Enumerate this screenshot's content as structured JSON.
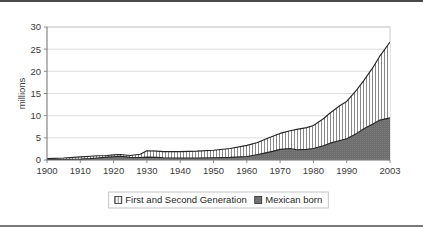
{
  "chart_data": {
    "type": "area",
    "stacked": true,
    "title": "",
    "subtitle": "",
    "xlabel": "",
    "ylabel": "millions",
    "xlim": [
      1900,
      2003
    ],
    "ylim": [
      0,
      30
    ],
    "ytick_values": [
      0,
      5,
      10,
      15,
      20,
      25,
      30
    ],
    "ytick_labels": [
      "0",
      "5",
      "10",
      "15",
      "20",
      "25",
      "30"
    ],
    "xtick_values": [
      1900,
      1910,
      1920,
      1930,
      1940,
      1950,
      1960,
      1970,
      1980,
      1990,
      2003
    ],
    "xtick_labels": [
      "1900",
      "1910",
      "1920",
      "1930",
      "1940",
      "1950",
      "1960",
      "1970",
      "1980",
      "1990",
      "2003"
    ],
    "grid": "horizontal",
    "legend_position": "bottom",
    "x": [
      1900,
      1905,
      1910,
      1913,
      1915,
      1918,
      1920,
      1922,
      1925,
      1928,
      1930,
      1933,
      1935,
      1940,
      1945,
      1950,
      1955,
      1960,
      1963,
      1965,
      1968,
      1970,
      1973,
      1975,
      1978,
      1980,
      1983,
      1985,
      1988,
      1990,
      1993,
      1995,
      1998,
      2000,
      2003
    ],
    "series": [
      {
        "name": "Mexican born",
        "color": "#6e6e6e",
        "pattern": "solid-gray",
        "values": [
          0.1,
          0.12,
          0.2,
          0.3,
          0.45,
          0.65,
          0.75,
          0.85,
          0.6,
          0.55,
          0.65,
          0.6,
          0.5,
          0.45,
          0.45,
          0.5,
          0.6,
          0.8,
          1.2,
          1.5,
          2.0,
          2.4,
          2.6,
          2.3,
          2.4,
          2.6,
          3.2,
          3.8,
          4.4,
          4.8,
          6.0,
          7.0,
          8.2,
          9.0,
          9.5
        ]
      },
      {
        "name": "First and Second Generation",
        "color": "#ffffff",
        "pattern": "vertical-hatch",
        "values": [
          0.3,
          0.45,
          0.7,
          0.85,
          0.95,
          1.0,
          1.15,
          1.25,
          1.0,
          1.3,
          2.1,
          2.0,
          1.9,
          1.9,
          2.0,
          2.2,
          2.6,
          3.3,
          3.9,
          4.5,
          5.4,
          6.0,
          6.6,
          6.9,
          7.3,
          7.8,
          9.3,
          10.6,
          12.3,
          13.2,
          15.8,
          17.8,
          21.0,
          23.5,
          26.6
        ]
      }
    ],
    "series_note": "First and Second Generation values are cumulative totals (top of stacked area); Mexican born is the lower band."
  },
  "legend": {
    "entries": [
      {
        "label": "First and Second Generation",
        "swatch": "vertical-hatch"
      },
      {
        "label": "Mexican born",
        "swatch": "solid-gray"
      }
    ]
  },
  "axis": {
    "y_title": "millions"
  }
}
